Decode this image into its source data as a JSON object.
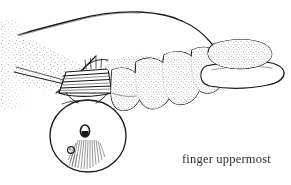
{
  "figure": {
    "title": "finger uppermost",
    "caption": {
      "text": "finger uppermost",
      "x": 182,
      "y": 153
    },
    "ink_color": "#1a1a1a",
    "background_color": "#ffffff",
    "parts": [
      {
        "name": "hand-back",
        "label": "back of hand"
      },
      {
        "name": "wrist",
        "label": "wrist"
      },
      {
        "name": "index-finger-pointing",
        "label": "pointing index finger"
      },
      {
        "name": "curled-fingers",
        "label": "curled fingers"
      },
      {
        "name": "thumb",
        "label": "thumb"
      },
      {
        "name": "wound-band",
        "label": "wound band"
      },
      {
        "name": "ball",
        "label": "ball"
      },
      {
        "name": "ball-highlight",
        "label": "ball highlight"
      },
      {
        "name": "ball-bead",
        "label": "small bead"
      }
    ]
  },
  "canvas": {
    "width": 291,
    "height": 185
  }
}
